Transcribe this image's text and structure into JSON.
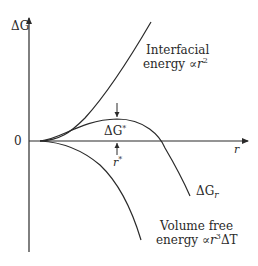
{
  "diagram": {
    "axes": {
      "y_label": "ΔG",
      "x_label": "r",
      "origin_label": "0"
    },
    "curves": [
      {
        "name": "interfacial-energy",
        "label_line1": "Interfacial",
        "label_line2_prefix": "energy ∝",
        "label_line2_var": "r",
        "label_line2_sup": "2"
      },
      {
        "name": "total-free-energy",
        "label_main": "ΔG",
        "label_sub": "r"
      },
      {
        "name": "volume-free-energy",
        "label_line1": "Volume free",
        "label_line2_prefix": "energy ∝",
        "label_line2_var": "r",
        "label_line2_sup": "3",
        "label_line2_suffix": "ΔT"
      }
    ],
    "annotations": {
      "critical_energy": {
        "main": "ΔG",
        "sup": "*"
      },
      "critical_radius": {
        "main": "r",
        "sup": "*"
      }
    },
    "colors": {
      "line": "#2a2a2a",
      "background": "#ffffff"
    }
  }
}
